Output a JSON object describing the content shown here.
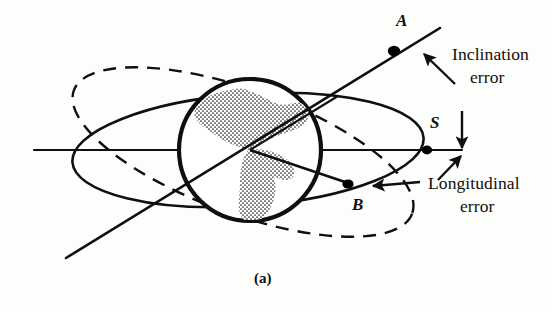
{
  "figure": {
    "caption": "(a)",
    "background_color": "#fdfdfc",
    "ink_color": "#100f0d"
  },
  "labels": {
    "point_a": "A",
    "point_b": "B",
    "point_s": "S",
    "inclination_error_line1": "Inclination",
    "inclination_error_line2": "error",
    "longitudinal_error_line1": "Longitudinal",
    "longitudinal_error_line2": "error"
  },
  "icons": {
    "earth": "earth-globe-icon",
    "nominal_orbit": "nominal-orbit-ellipse-icon",
    "inclined_orbit": "inclined-orbit-dashed-ellipse-icon",
    "node_line": "line-of-nodes-icon",
    "equatorial_axis": "equatorial-axis-icon",
    "inclination_arrow": "inclination-error-arrow-icon",
    "longitudinal_arrow_upper": "longitudinal-error-arrow-upper-icon",
    "longitudinal_arrow_lower": "longitudinal-error-arrow-lower-icon",
    "point_marker": "point-marker-dot-icon"
  },
  "geometry": {
    "axis": {
      "x1": 34,
      "y1": 150,
      "x2": 462,
      "y2": 150
    },
    "earth": {
      "cx": 250,
      "cy": 150,
      "r": 72
    },
    "nominal_ellipse": {
      "cx": 248,
      "cy": 150,
      "rx": 176,
      "ry": 56,
      "rotation_deg": -4
    },
    "inclined_ellipse": {
      "cx": 243,
      "cy": 152,
      "rx": 180,
      "ry": 62,
      "rotation_deg": 20
    },
    "node_line": {
      "x1": 66,
      "y1": 258,
      "x2": 440,
      "y2": 28
    },
    "point_a": {
      "x": 394,
      "y": 50
    },
    "point_b": {
      "x": 348,
      "y": 184
    },
    "point_s": {
      "x": 427,
      "y": 150
    }
  }
}
